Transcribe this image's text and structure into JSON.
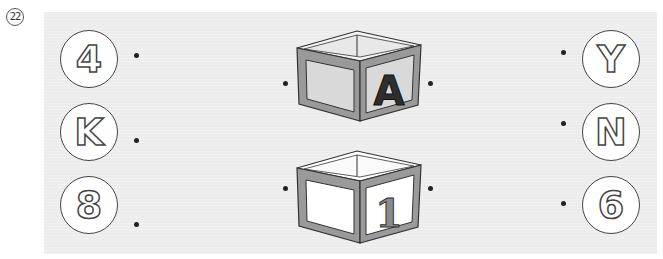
{
  "question_number": "22",
  "left_items": [
    {
      "label": "4"
    },
    {
      "label": "K"
    },
    {
      "label": "8"
    }
  ],
  "right_items": [
    {
      "label": "Y"
    },
    {
      "label": "N"
    },
    {
      "label": "6"
    }
  ],
  "blocks": [
    {
      "label": "A",
      "face_color": "#d9d9d9",
      "letter_color": "#2e2e2e"
    },
    {
      "label": "1",
      "face_color": "#ffffff",
      "letter_color": "#8a8a8a"
    }
  ],
  "colors": {
    "panel": "#ececec",
    "block_frame": "#9a9a9a",
    "outline": "#333333"
  }
}
